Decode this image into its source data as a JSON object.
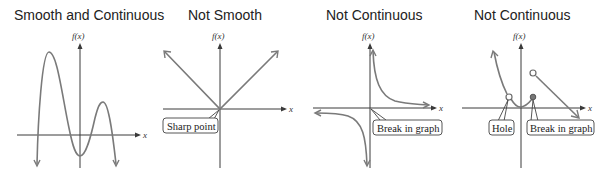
{
  "panels": [
    {
      "title": "Smooth and Continuous",
      "y_axis_label": "f(x)",
      "x_axis_label": "x",
      "callouts": []
    },
    {
      "title": "Not Smooth",
      "y_axis_label": "f(x)",
      "x_axis_label": "x",
      "callouts": [
        {
          "label": "Sharp point"
        }
      ]
    },
    {
      "title": "Not Continuous",
      "y_axis_label": "f(x)",
      "x_axis_label": "x",
      "callouts": [
        {
          "label": "Break in graph"
        }
      ]
    },
    {
      "title": "Not Continuous",
      "y_axis_label": "f(x)",
      "x_axis_label": "x",
      "callouts": [
        {
          "label": "Hole"
        },
        {
          "label": "Break in graph"
        }
      ]
    }
  ],
  "colors": {
    "axis": "#3a3a3a",
    "curve": "#7a7a7a",
    "callout_border": "#444444",
    "text": "#222222"
  }
}
